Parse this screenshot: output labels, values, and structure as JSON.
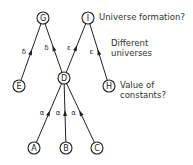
{
  "diagram": {
    "nodes": [
      {
        "id": "G",
        "label": "G",
        "x": 43,
        "y": 18
      },
      {
        "id": "I",
        "label": "I",
        "x": 88,
        "y": 18
      },
      {
        "id": "E",
        "label": "E",
        "x": 19,
        "y": 86
      },
      {
        "id": "D",
        "label": "D",
        "x": 64,
        "y": 78
      },
      {
        "id": "H",
        "label": "H",
        "x": 109,
        "y": 86
      },
      {
        "id": "A",
        "label": "A",
        "x": 34,
        "y": 148
      },
      {
        "id": "B",
        "label": "B",
        "x": 66,
        "y": 148
      },
      {
        "id": "C",
        "label": "C",
        "x": 97,
        "y": 148
      }
    ],
    "edges": [
      {
        "from": "G",
        "to": "E",
        "label": "δ"
      },
      {
        "from": "G",
        "to": "D",
        "label": "δ"
      },
      {
        "from": "I",
        "to": "D",
        "label": "ε"
      },
      {
        "from": "I",
        "to": "H",
        "label": "ε"
      },
      {
        "from": "D",
        "to": "A",
        "label": "α"
      },
      {
        "from": "D",
        "to": "B",
        "label": "α"
      },
      {
        "from": "D",
        "to": "C",
        "label": "α"
      }
    ],
    "annotations": {
      "universe_formation": "Universe formation?",
      "different_universes_line1": "Different",
      "different_universes_line2": "universes",
      "value_constants_line1": "Value of",
      "value_constants_line2": "constants?"
    }
  }
}
